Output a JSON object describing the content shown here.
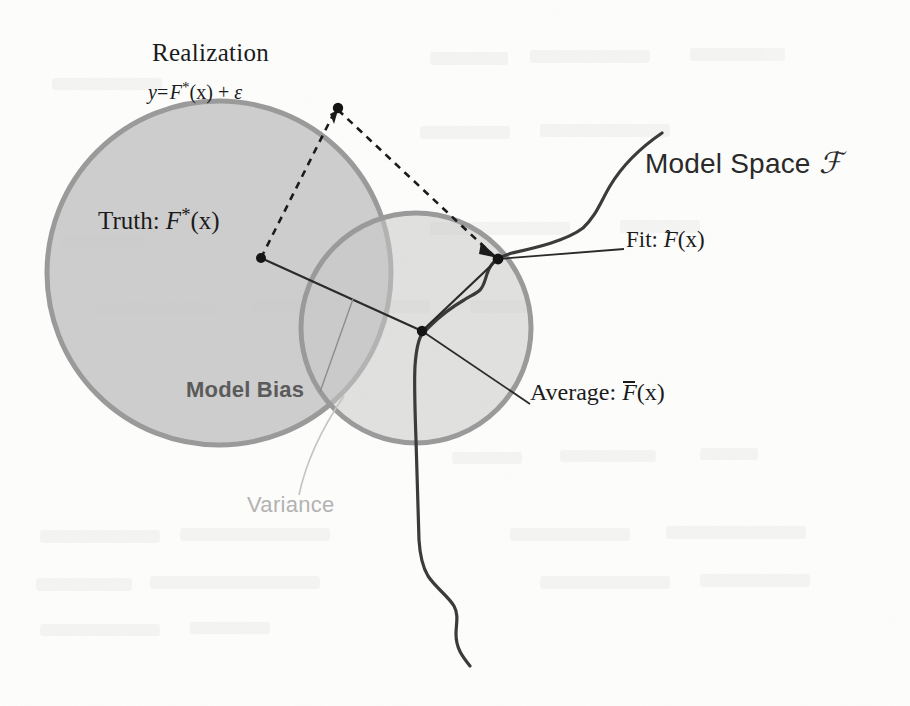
{
  "figure": {
    "background_color": "#fdfdfc",
    "ink_color": "#1b1b1b",
    "shade_color": "#c9c9c9",
    "circle_stroke_color": "#9a9a9a",
    "bias_text_color": "#5b5b5b",
    "variance_text_color": "#b2b2b2"
  },
  "labels": {
    "realization": "Realization",
    "realization_formula": {
      "y": "y",
      "equals": "=",
      "F": "F",
      "star": "*",
      "arg": "(x)",
      "plus": "+",
      "epsilon": "ε",
      "full": "y = F*(x) + ε"
    },
    "truth": {
      "prefix": "Truth:",
      "F": "F",
      "star": "*",
      "arg": "(x)",
      "full": "Truth: F*(x)"
    },
    "model_space": {
      "prefix": "Model Space",
      "symbol": "ℱ",
      "full": "Model Space ℱ"
    },
    "fit": {
      "prefix": "Fit:",
      "F": "F",
      "accent": "ˆ",
      "arg": "(x)",
      "full": "Fit: F̂(x)"
    },
    "average": {
      "prefix": "Average:",
      "F": "F",
      "accent": "¯",
      "arg": "(x)",
      "full": "Average: F̄(x)"
    },
    "model_bias": "Model Bias",
    "variance": "Variance"
  },
  "points": [
    {
      "name": "realization-point",
      "x": 338,
      "y": 108
    },
    {
      "name": "truth-point",
      "x": 261,
      "y": 258
    },
    {
      "name": "fit-point",
      "x": 498,
      "y": 259
    },
    {
      "name": "average-point",
      "x": 422,
      "y": 331
    }
  ],
  "circles": [
    {
      "name": "truth-region-circle",
      "cx": 219,
      "cy": 273,
      "r": 172,
      "fill": "#c9c9c9",
      "stroke": "#9a9a9a"
    },
    {
      "name": "variance-region-circle",
      "cx": 416,
      "cy": 328,
      "r": 115,
      "fill": "#c9c9c9",
      "stroke": "#9a9a9a"
    }
  ],
  "edges": [
    {
      "name": "truth-to-realization",
      "style": "dashed",
      "from": "truth-point",
      "to": "realization-point"
    },
    {
      "name": "realization-to-fit",
      "style": "dashed",
      "from": "realization-point",
      "to": "fit-point"
    },
    {
      "name": "truth-to-average",
      "style": "solid",
      "from": "truth-point",
      "to": "average-point"
    },
    {
      "name": "average-to-fit",
      "style": "solid",
      "from": "average-point",
      "to": "fit-point"
    }
  ],
  "leaders": [
    {
      "name": "fit-leader-line",
      "from_x": 498,
      "from_y": 259,
      "to_x": 622,
      "to_y": 248
    },
    {
      "name": "average-leader-line",
      "from_x": 422,
      "from_y": 331,
      "to_x": 527,
      "to_y": 402
    },
    {
      "name": "model-bias-leader-line",
      "from_x": 318,
      "from_y": 392,
      "to_x": 352,
      "to_y": 300
    },
    {
      "name": "variance-leader-line",
      "from_x": 300,
      "from_y": 492,
      "to_x": 344,
      "to_y": 396
    }
  ],
  "model_space_curve": {
    "name": "model-space-curve",
    "description": "Wavy curve representing the model space manifold passing through the fit and average points",
    "path": "M 662 133 C 640 148 622 166 610 186 C 600 203 596 216 583 228 C 566 241 534 248 512 253 C 505 255 501 257 498 259 C 492 262 489 268 487 274 C 485 280 484 286 480 290 C 476 294 470 296 464 300 C 452 307 438 318 430 326 C 426 330 424 332 422 334 C 418 340 416 352 415 366 C 414 385 415 412 416 440 C 417 470 418 510 419 540 C 420 556 422 566 428 576 C 436 588 448 596 454 606 C 459 615 456 624 456 634 C 456 648 462 656 470 666"
  }
}
